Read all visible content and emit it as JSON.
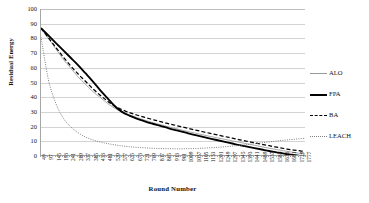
{
  "chart_data": {
    "type": "line",
    "title": "",
    "xlabel": "Round Number",
    "ylabel": "Residual Energy",
    "ylim": [
      0,
      100
    ],
    "ytick_labels": [
      "100",
      "90",
      "80",
      "70",
      "60",
      "50",
      "40",
      "30",
      "20",
      "10",
      "0"
    ],
    "yticks": [
      100,
      90,
      80,
      70,
      60,
      50,
      40,
      30,
      20,
      10,
      0
    ],
    "grid": "horizontal",
    "legend_position": "right",
    "x": [
      49,
      97,
      145,
      193,
      241,
      289,
      337,
      385,
      433,
      481,
      529,
      577,
      625,
      673,
      721,
      769,
      817,
      865,
      913,
      961,
      1009,
      1057,
      1105,
      1153,
      1201,
      1249,
      1297,
      1345,
      1393,
      1441,
      1489,
      1537,
      1585,
      1633,
      1681,
      1729,
      1777
    ],
    "xtick_labels": [
      "49",
      "97",
      "145",
      "193",
      "241",
      "289",
      "337",
      "385",
      "433",
      "481",
      "529",
      "577",
      "625",
      "673",
      "721",
      "769",
      "817",
      "865",
      "913",
      "961",
      "1009",
      "1057",
      "1105",
      "1153",
      "1201",
      "1249",
      "1297",
      "1345",
      "1393",
      "1441",
      "1489",
      "1537",
      "1585",
      "1633",
      "1681",
      "1729",
      "1777"
    ],
    "series": [
      {
        "name": "ALO",
        "style": "solid-thin",
        "color": "#999999",
        "values": [
          87,
          80,
          73,
          66,
          60,
          54,
          49,
          44,
          40,
          36,
          32.5,
          30,
          28,
          26.2,
          24.5,
          23,
          21.6,
          20.3,
          19,
          17.8,
          16.6,
          15.5,
          14.4,
          13.3,
          12.3,
          11.3,
          10.3,
          9.3,
          8.3,
          7.3,
          6.3,
          5.3,
          4.4,
          3.5,
          2.7,
          1.9,
          1.2
        ]
      },
      {
        "name": "FPA",
        "style": "solid-thick",
        "color": "#000000",
        "values": [
          87,
          82,
          77,
          72,
          67,
          62,
          56.5,
          51,
          45,
          39.5,
          34,
          30,
          27.5,
          25.5,
          23.8,
          22.2,
          20.8,
          19.4,
          18,
          16.7,
          15.4,
          14.2,
          13,
          11.8,
          10.7,
          9.6,
          8.5,
          7.4,
          6.4,
          5.4,
          4.4,
          3.4,
          2.5,
          1.6,
          0.9,
          0.3,
          -0.2
        ]
      },
      {
        "name": "BA",
        "style": "dashed",
        "color": "#000000",
        "values": [
          87,
          80.5,
          74,
          67.5,
          61.5,
          56,
          51,
          46,
          41.5,
          37.5,
          34,
          31.5,
          29.6,
          27.9,
          26.4,
          25,
          23.7,
          22.4,
          21.2,
          20,
          18.8,
          17.6,
          16.5,
          15.4,
          14.3,
          13.2,
          12.1,
          11,
          10,
          9,
          8,
          7,
          6,
          5.1,
          4.3,
          3.6,
          3
        ]
      },
      {
        "name": "LEACH",
        "style": "dotted",
        "color": "#808080",
        "values": [
          81,
          52,
          36,
          26,
          20,
          16,
          13,
          11,
          9.6,
          8.5,
          7.6,
          6.9,
          6.3,
          5.9,
          5.6,
          5.3,
          5.1,
          5,
          4.9,
          4.9,
          5,
          5.1,
          5.3,
          5.6,
          5.9,
          6.3,
          6.8,
          7.3,
          7.8,
          8.4,
          9,
          9.6,
          10.2,
          10.7,
          11.2,
          11.7,
          12.1
        ]
      }
    ]
  },
  "legend": {
    "items": [
      {
        "label": "ALO"
      },
      {
        "label": "FPA"
      },
      {
        "label": "BA"
      },
      {
        "label": "LEACH"
      }
    ]
  }
}
